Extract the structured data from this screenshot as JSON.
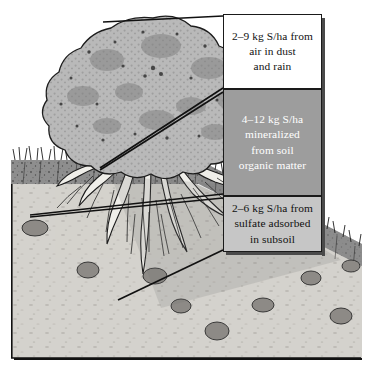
{
  "figure": {
    "background_color": "#ffffff"
  },
  "illustration": {
    "name": "tree-and-soil-profile-cutaway",
    "description": "Cutaway drawing of a broadleaf tree with spreading root system in a soil profile, showing topsoil, subsoil and scattered stones",
    "parts": [
      "tree-canopy",
      "tree-trunk",
      "root-system",
      "grass-line",
      "topsoil-layer",
      "subsoil-layer",
      "stones"
    ],
    "colors": {
      "canopy": "#b5b5b5",
      "topsoil": "#8e8e8e",
      "subsoil": "#d4d2cd",
      "stone": "#8d8a86",
      "outline": "#1a1a1a"
    }
  },
  "callouts": [
    {
      "id": "air",
      "name": "callout-air-dust-rain",
      "text": "2–9 kg S/ha from air in dust and rain",
      "lines": [
        "2–9 kg S/ha from",
        "air in dust",
        "and rain"
      ],
      "amount_low_kg_per_ha": 2,
      "amount_high_kg_per_ha": 9,
      "source": "air in dust and rain",
      "background_color": "#ffffff",
      "text_color": "#111111"
    },
    {
      "id": "organic",
      "name": "callout-mineralized-soil-organic-matter",
      "text": "4–12 kg S/ha mineralized from soil organic matter",
      "lines": [
        "4–12 kg S/ha",
        "mineralized",
        "from soil",
        "organic matter"
      ],
      "amount_low_kg_per_ha": 4,
      "amount_high_kg_per_ha": 12,
      "source": "mineralized from soil organic matter",
      "background_color": "#9d9d9d",
      "text_color": "#ffffff"
    },
    {
      "id": "subsoil",
      "name": "callout-sulfate-adsorbed-subsoil",
      "text": "2–6 kg S/ha from sulfate adsorbed in subsoil",
      "lines": [
        "2–6 kg S/ha from",
        "sulfate adsorbed",
        "in subsoil"
      ],
      "amount_low_kg_per_ha": 2,
      "amount_high_kg_per_ha": 6,
      "source": "sulfate adsorbed in subsoil",
      "background_color": "#c6c6c6",
      "text_color": "#111111"
    }
  ],
  "leader_lines": {
    "name": "callout-leader-lines",
    "color": "#111111",
    "count": 6
  }
}
